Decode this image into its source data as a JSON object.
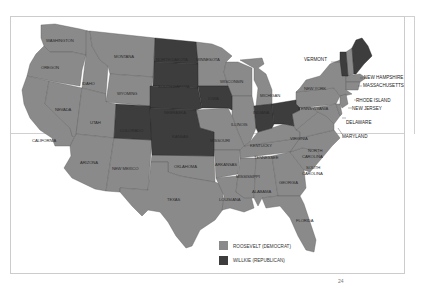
{
  "map": {
    "title": "",
    "colors": {
      "roosevelt": "#8a8a8a",
      "willkie": "#3d3d3d",
      "border": "#555555",
      "frame": "#cfcfcf"
    },
    "state_labels": {
      "washington": "WASHINGTON",
      "oregon": "OREGON",
      "california": "CALIFORNIA",
      "nevada": "NEVADA",
      "idaho": "IDAHO",
      "montana": "MONTANA",
      "wyoming": "WYOMING",
      "utah": "UTAH",
      "arizona": "ARIZONA",
      "new_mexico": "NEW MEXICO",
      "colorado": "COLORADO",
      "north_dakota": "NORTH DAKOTA",
      "south_dakota": "SOUTH DAKOTA",
      "nebraska": "NEBRASKA",
      "kansas": "KANSAS",
      "oklahoma": "OKLAHOMA",
      "texas": "TEXAS",
      "minnesota": "MINNESOTA",
      "iowa": "IOWA",
      "missouri": "MISSOURI",
      "arkansas": "ARKANSAS",
      "louisiana": "LOUISIANA",
      "wisconsin": "WISCONSIN",
      "illinois": "ILLINOIS",
      "michigan": "MICHIGAN",
      "indiana": "INDIANA",
      "ohio": "OHIO",
      "kentucky": "KENTUCKY",
      "tennessee": "TENNESSEE",
      "mississippi": "MISSISSIPPI",
      "alabama": "ALABAMA",
      "georgia": "GEORGIA",
      "florida": "FLORIDA",
      "south_carolina_1": "SOUTH",
      "south_carolina_2": "CAROLINA",
      "north_carolina_1": "NORTH",
      "north_carolina_2": "CAROLINA",
      "virginia": "VIRGINIA",
      "west_virginia": "W. VA.",
      "pennsylvania": "PENNSYLVANIA",
      "new_york": "NEW YORK",
      "vermont": "VERMONT",
      "new_hampshire": "NEW HAMPSHIRE",
      "massachusetts": "MASSACHUSETTS",
      "rhode_island": "RHODE ISLAND",
      "new_jersey": "NEW JERSEY",
      "delaware": "DELAWARE",
      "maryland": "MARYLAND"
    },
    "willkie_states": [
      "Maine",
      "Vermont",
      "North Dakota",
      "South Dakota",
      "Nebraska",
      "Kansas",
      "Colorado",
      "Iowa",
      "Indiana",
      "Ohio"
    ],
    "legend": [
      {
        "label": "ROOSEVELT (DEMOCRAT)",
        "color": "#8a8a8a"
      },
      {
        "label": "WILLKIE (REPUBLICAN)",
        "color": "#3d3d3d"
      }
    ]
  },
  "page_number": "24"
}
